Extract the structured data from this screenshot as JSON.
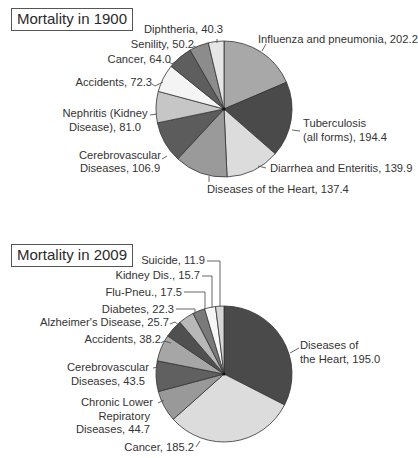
{
  "chart_data": [
    {
      "type": "pie",
      "title": "Mortality in 1900",
      "center": [
        224,
        109
      ],
      "radius": 68,
      "start_angle_deg": 0,
      "direction": "clockwise",
      "slices": [
        {
          "label": "Influenza and pneumonia",
          "value": 202.2,
          "color": "#a8a8a8"
        },
        {
          "label": "Tuberculosis (all forms)",
          "value": 194.4,
          "color": "#4a4a4a"
        },
        {
          "label": "Diarrhea and Enteritis",
          "value": 139.9,
          "color": "#dcdcdc"
        },
        {
          "label": "Diseases of the Heart",
          "value": 137.4,
          "color": "#9a9a9a"
        },
        {
          "label": "Cerebrovascular Diseases",
          "value": 106.9,
          "color": "#5c5c5c"
        },
        {
          "label": "Nephritis (Kidney Disease)",
          "value": 81.0,
          "color": "#c6c6c6"
        },
        {
          "label": "Accidents",
          "value": 72.3,
          "color": "#f4f4f4"
        },
        {
          "label": "Cancer",
          "value": 64.0,
          "color": "#5e5e5e"
        },
        {
          "label": "Senility",
          "value": 50.2,
          "color": "#8c8c8c"
        },
        {
          "label": "Diphtheria",
          "value": 40.3,
          "color": "#e6e6e6"
        }
      ]
    },
    {
      "type": "pie",
      "title": "Mortality in 2009",
      "center": [
        224,
        374
      ],
      "radius": 68,
      "start_angle_deg": 0,
      "direction": "clockwise",
      "slices": [
        {
          "label": "Diseases of the Heart",
          "value": 195.0,
          "color": "#4a4a4a"
        },
        {
          "label": "Cancer",
          "value": 185.2,
          "color": "#dcdcdc"
        },
        {
          "label": "Chronic Lower Repiratory Diseases",
          "value": 44.7,
          "color": "#999999"
        },
        {
          "label": "Cerebrovascular Diseases",
          "value": 43.5,
          "color": "#606060"
        },
        {
          "label": "Accidents",
          "value": 38.2,
          "color": "#a6a6a6"
        },
        {
          "label": "Alzheimer's Disease",
          "value": 25.7,
          "color": "#505050"
        },
        {
          "label": "Diabetes",
          "value": 22.3,
          "color": "#b8b8b8"
        },
        {
          "label": "Flu-Pneu.",
          "value": 17.5,
          "color": "#7a7a7a"
        },
        {
          "label": "Kidney Dis.",
          "value": 15.7,
          "color": "#f6f6f6"
        },
        {
          "label": "Suicide",
          "value": 11.9,
          "color": "#d6d6d6"
        }
      ]
    }
  ],
  "chart1": {
    "title": "Mortality in 1900",
    "labels": {
      "influenza": "Influenza and pneumonia, 202.2",
      "tb_1": "Tuberculosis",
      "tb_2": "(all forms), 194.4",
      "diarrhea": "Diarrhea and Enteritis, 139.9",
      "heart": "Diseases of the Heart, 137.4",
      "cerebro_1": "Cerebrovascular",
      "cerebro_2": "Diseases, 106.9",
      "nephritis_1": "Nephritis (Kidney",
      "nephritis_2": "Disease), 81.0",
      "accidents": "Accidents, 72.3",
      "cancer": "Cancer, 64.0",
      "senility": "Senility, 50.2",
      "diphtheria": "Diphtheria, 40.3"
    }
  },
  "chart2": {
    "title": "Mortality in 2009",
    "labels": {
      "heart_1": "Diseases of",
      "heart_2": "the Heart, 195.0",
      "cancer": "Cancer, 185.2",
      "clrd_1": "Chronic Lower",
      "clrd_2": "Repiratory",
      "clrd_3": "Diseases, 44.7",
      "cerebro_1": "Cerebrovascular",
      "cerebro_2": "Diseases, 43.5",
      "accidents": "Accidents, 38.2",
      "alzheimers": "Alzheimer's Disease, 25.7",
      "diabetes": "Diabetes, 22.3",
      "flu": "Flu-Pneu., 17.5",
      "kidney": "Kidney Dis., 15.7",
      "suicide": "Suicide, 11.9"
    }
  }
}
